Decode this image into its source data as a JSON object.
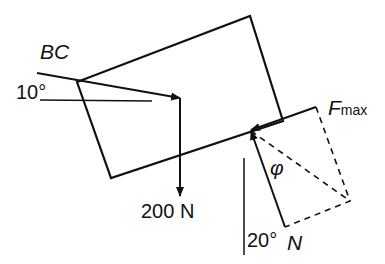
{
  "diagram": {
    "type": "free-body diagram",
    "labels": {
      "bc": "BC",
      "angle_bc": "10°",
      "weight": "200 N",
      "fmax_main": "F",
      "fmax_sub": "max",
      "phi": "φ",
      "angle_n": "20°",
      "normal": "N"
    },
    "colors": {
      "stroke": "#111111",
      "background": "#ffffff"
    }
  }
}
